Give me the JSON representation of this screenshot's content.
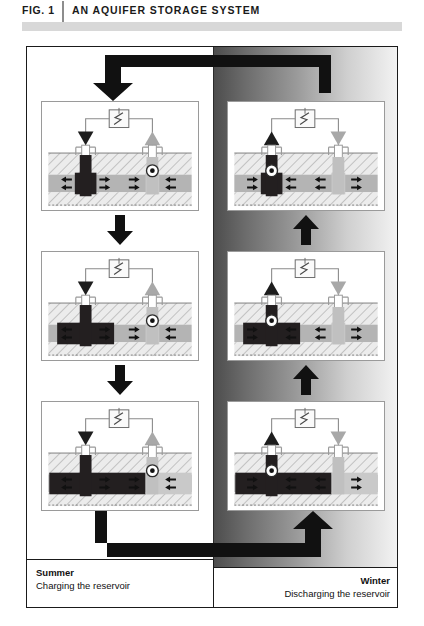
{
  "header": {
    "fig_label": "FIG. 1",
    "title": "AN AQUIFER STORAGE SYSTEM"
  },
  "captions": {
    "summer": {
      "season": "Summer",
      "subtitle": "Charging the reservoir"
    },
    "winter": {
      "season": "Winter",
      "subtitle": "Discharging the reservoir"
    }
  },
  "colors": {
    "cold_plume": "#231f20",
    "warm_plume": "#c9c9c9",
    "aquifer": "#b4b4b4",
    "confining_layer": "#e9e9e9",
    "frame": "#1a1a1a",
    "winter_background_dark": "#4c4c4c",
    "winter_background_light": "#f4f4f4",
    "arrow": "#111111"
  },
  "icons": {
    "heat_exchanger": "heat-exchanger-icon",
    "pump": "pump-icon",
    "injection_marker": "down-triangle-icon",
    "production_marker": "up-triangle-icon",
    "flow_arrow": "flow-arrow-icon",
    "cycle_arrow": "cycle-arrow-icon",
    "step_arrow": "step-arrow-icon"
  },
  "columns": [
    {
      "name": "summer",
      "label": "Summer",
      "direction": "downward",
      "description": "Charging the reservoir",
      "panels": [
        {
          "stage": 1,
          "cold_plume_width": 22,
          "warm_plume_width": 14,
          "pump_side": "right",
          "left_marker": "down-triangle",
          "right_marker": "up-triangle"
        },
        {
          "stage": 2,
          "cold_plume_width": 58,
          "warm_plume_width": 14,
          "pump_side": "right",
          "left_marker": "down-triangle",
          "right_marker": "up-triangle"
        },
        {
          "stage": 3,
          "cold_plume_width": 98,
          "warm_plume_width": 14,
          "pump_side": "right",
          "left_marker": "down-triangle",
          "right_marker": "up-triangle"
        }
      ]
    },
    {
      "name": "winter",
      "label": "Winter",
      "direction": "upward",
      "description": "Discharging the reservoir",
      "panels": [
        {
          "stage": 1,
          "cold_plume_width": 22,
          "warm_plume_width": 14,
          "pump_side": "left",
          "left_marker": "up-triangle",
          "right_marker": "down-triangle"
        },
        {
          "stage": 2,
          "cold_plume_width": 58,
          "warm_plume_width": 14,
          "pump_side": "left",
          "left_marker": "up-triangle",
          "right_marker": "down-triangle"
        },
        {
          "stage": 3,
          "cold_plume_width": 98,
          "warm_plume_width": 14,
          "pump_side": "left",
          "left_marker": "up-triangle",
          "right_marker": "down-triangle"
        }
      ]
    }
  ]
}
